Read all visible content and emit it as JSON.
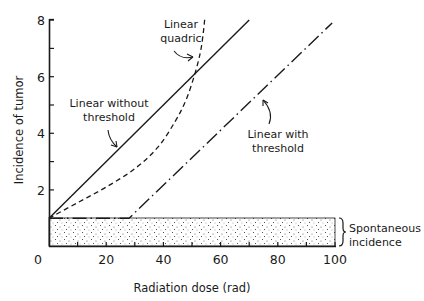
{
  "chart_data": {
    "type": "line",
    "title": "",
    "xlabel": "Radiation dose (rad)",
    "ylabel": "Incidence of tumor",
    "xlim": [
      0,
      100
    ],
    "ylim": [
      0,
      8
    ],
    "grid": false,
    "x_ticks": [
      0,
      20,
      40,
      60,
      80,
      100
    ],
    "x_minor_ticks": [
      10,
      30,
      50,
      70,
      90
    ],
    "y_ticks": [
      2,
      4,
      6,
      8
    ],
    "y_minor_ticks": [
      3,
      5,
      7
    ],
    "series": [
      {
        "name": "Linear without threshold",
        "style": "solid",
        "x": [
          0,
          70
        ],
        "y": [
          1,
          8
        ]
      },
      {
        "name": "Linear quadric",
        "style": "dashed",
        "x": [
          0,
          10,
          20,
          30,
          38,
          44,
          48,
          51,
          53,
          54,
          54.5
        ],
        "y": [
          1,
          1.55,
          2.1,
          2.75,
          3.5,
          4.4,
          5.2,
          6.1,
          6.9,
          7.6,
          8.1
        ]
      },
      {
        "name": "Linear with threshold",
        "style": "dash-dot",
        "x": [
          0,
          28,
          99
        ],
        "y": [
          1,
          1,
          7.9
        ]
      }
    ],
    "bands": [
      {
        "name": "Spontaneous incidence",
        "y0": 0,
        "y1": 1,
        "fill": "stippled"
      }
    ],
    "annotations": [
      {
        "text": [
          "Linear",
          "quadric"
        ],
        "points_to": "Linear quadric"
      },
      {
        "text": [
          "Linear without",
          "threshold"
        ],
        "points_to": "Linear without threshold"
      },
      {
        "text": [
          "Linear with",
          "threshold"
        ],
        "points_to": "Linear with threshold"
      },
      {
        "text": [
          "Spontaneous",
          "incidence"
        ],
        "points_to": "Spontaneous incidence band"
      }
    ]
  },
  "labels": {
    "x_axis_title": "Radiation dose (rad)",
    "y_axis_title": "Incidence of tumor",
    "x_ticks": [
      "0",
      "20",
      "40",
      "60",
      "80",
      "100"
    ],
    "y_ticks": [
      "2",
      "4",
      "6",
      "8"
    ],
    "annot_quadric_1": "Linear",
    "annot_quadric_2": "quadric",
    "annot_nothresh_1": "Linear without",
    "annot_nothresh_2": "threshold",
    "annot_thresh_1": "Linear with",
    "annot_thresh_2": "threshold",
    "annot_spont_1": "Spontaneous",
    "annot_spont_2": "incidence"
  },
  "colors": {
    "ink": "#1a1a1a",
    "background": "#ffffff"
  }
}
